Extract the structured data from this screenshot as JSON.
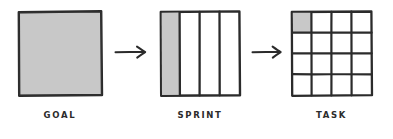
{
  "diagram": {
    "type": "flow-diagram",
    "background_color": "#ffffff",
    "stroke_color": "#2b2b2b",
    "fill_color": "#c8c8c8",
    "style": "hand-drawn sketch",
    "stages": [
      {
        "id": "goal",
        "label": "GOAL",
        "shape": "square",
        "subdivisions": 1,
        "columns": 1,
        "rows": 1,
        "filled_cells": 1,
        "filled_cell_index": "0",
        "x": 17,
        "y": 10,
        "width": 86,
        "height": 87
      },
      {
        "id": "sprint",
        "label": "SPRINT",
        "shape": "square-columns",
        "subdivisions": 4,
        "columns": 4,
        "rows": 1,
        "filled_cells": 1,
        "filled_cell_index": "0",
        "x": 159,
        "y": 10,
        "width": 82,
        "height": 87
      },
      {
        "id": "task",
        "label": "TASK",
        "shape": "square-grid",
        "subdivisions": 16,
        "columns": 4,
        "rows": 4,
        "filled_cells": 1,
        "filled_cell_index": "0,0",
        "x": 290,
        "y": 10,
        "width": 83,
        "height": 87
      }
    ],
    "arrows": [
      {
        "id": "arrow-goal-to-sprint",
        "glyph": "right-arrow",
        "from": "goal",
        "to": "sprint",
        "x": 114,
        "y": 44,
        "length": 36
      },
      {
        "id": "arrow-sprint-to-task",
        "glyph": "right-arrow",
        "from": "sprint",
        "to": "task",
        "x": 251,
        "y": 44,
        "length": 34
      }
    ]
  }
}
